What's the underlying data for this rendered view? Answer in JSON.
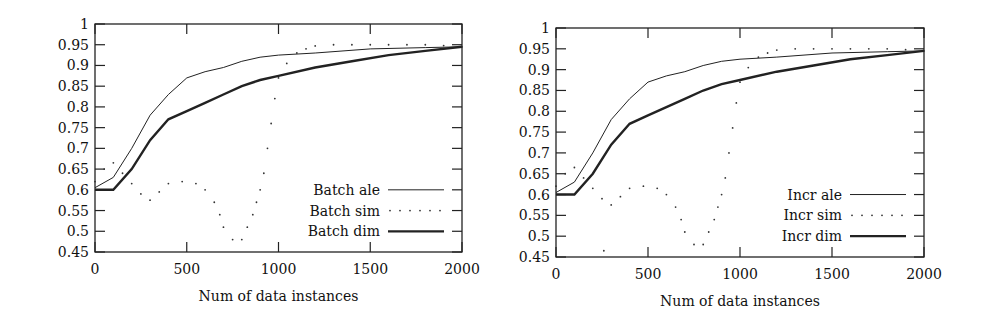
{
  "chart_data": [
    {
      "type": "line",
      "title": "",
      "xlabel": "Num of data instances",
      "ylabel": "",
      "xlim": [
        0,
        2000
      ],
      "ylim": [
        0.45,
        1
      ],
      "xticks": [
        0,
        500,
        1000,
        1500,
        2000
      ],
      "yticks": [
        0.45,
        0.5,
        0.55,
        0.6,
        0.65,
        0.7,
        0.75,
        0.8,
        0.85,
        0.9,
        0.95,
        1
      ],
      "ytick_labels": [
        "0.45",
        "0.5",
        "0.55",
        "0.6",
        "0.65",
        "0.7",
        "0.75",
        "0.8",
        "0.85",
        "0.9",
        "0.95",
        "1"
      ],
      "grid": false,
      "legend_position": "lower right",
      "series": [
        {
          "name": "Batch ale",
          "style": "thin",
          "x": [
            0,
            100,
            200,
            300,
            400,
            500,
            600,
            700,
            800,
            900,
            1000,
            1200,
            1500,
            1800,
            2000
          ],
          "y": [
            0.605,
            0.63,
            0.7,
            0.78,
            0.83,
            0.87,
            0.885,
            0.895,
            0.91,
            0.92,
            0.925,
            0.93,
            0.94,
            0.943,
            0.945
          ]
        },
        {
          "name": "Batch sim",
          "style": "dotted",
          "x": [
            0,
            50,
            100,
            150,
            200,
            250,
            300,
            350,
            400,
            475,
            550,
            600,
            650,
            680,
            700,
            750,
            800,
            830,
            860,
            880,
            900,
            920,
            940,
            960,
            980,
            1000,
            1045,
            1100,
            1150,
            1200,
            1300,
            1400,
            1500,
            1600,
            1700,
            1800,
            1900,
            2000
          ],
          "y": [
            0.62,
            0.65,
            0.665,
            0.64,
            0.615,
            0.59,
            0.575,
            0.595,
            0.615,
            0.62,
            0.615,
            0.6,
            0.57,
            0.54,
            0.51,
            0.48,
            0.48,
            0.51,
            0.54,
            0.57,
            0.6,
            0.64,
            0.7,
            0.76,
            0.82,
            0.87,
            0.905,
            0.93,
            0.94,
            0.947,
            0.95,
            0.95,
            0.95,
            0.95,
            0.95,
            0.95,
            0.948,
            0.945
          ]
        },
        {
          "name": "Batch dim",
          "style": "thick",
          "x": [
            0,
            100,
            200,
            300,
            400,
            500,
            600,
            700,
            800,
            900,
            1000,
            1200,
            1400,
            1600,
            1800,
            2000
          ],
          "y": [
            0.6,
            0.6,
            0.65,
            0.72,
            0.77,
            0.79,
            0.81,
            0.83,
            0.85,
            0.865,
            0.875,
            0.895,
            0.91,
            0.925,
            0.935,
            0.945
          ]
        }
      ]
    },
    {
      "type": "line",
      "title": "",
      "xlabel": "Num of data instances",
      "ylabel": "",
      "xlim": [
        0,
        2000
      ],
      "ylim": [
        0.45,
        1
      ],
      "xticks": [
        0,
        500,
        1000,
        1500,
        2000
      ],
      "yticks": [
        0.45,
        0.5,
        0.55,
        0.6,
        0.65,
        0.7,
        0.75,
        0.8,
        0.85,
        0.9,
        0.95,
        1
      ],
      "ytick_labels": [
        "0.45",
        "0.5",
        "0.55",
        "0.6",
        "0.65",
        "0.7",
        "0.75",
        "0.8",
        "0.85",
        "0.9",
        "0.95",
        "1"
      ],
      "grid": false,
      "legend_position": "lower right",
      "series": [
        {
          "name": "Incr ale",
          "style": "thin",
          "x": [
            0,
            100,
            200,
            300,
            400,
            500,
            600,
            700,
            800,
            900,
            1000,
            1200,
            1500,
            1800,
            2000
          ],
          "y": [
            0.605,
            0.63,
            0.7,
            0.78,
            0.83,
            0.87,
            0.885,
            0.895,
            0.91,
            0.92,
            0.925,
            0.93,
            0.94,
            0.943,
            0.945
          ]
        },
        {
          "name": "Incr sim",
          "style": "dotted",
          "x": [
            0,
            50,
            100,
            150,
            200,
            250,
            260,
            300,
            350,
            400,
            475,
            550,
            600,
            650,
            680,
            700,
            750,
            800,
            830,
            860,
            880,
            900,
            920,
            940,
            960,
            980,
            1000,
            1045,
            1100,
            1150,
            1200,
            1300,
            1400,
            1500,
            1600,
            1700,
            1800,
            1900,
            2000
          ],
          "y": [
            0.62,
            0.65,
            0.665,
            0.64,
            0.615,
            0.59,
            0.465,
            0.575,
            0.595,
            0.615,
            0.62,
            0.615,
            0.6,
            0.57,
            0.54,
            0.51,
            0.48,
            0.48,
            0.51,
            0.54,
            0.57,
            0.6,
            0.64,
            0.7,
            0.76,
            0.82,
            0.87,
            0.905,
            0.93,
            0.94,
            0.947,
            0.95,
            0.95,
            0.95,
            0.95,
            0.95,
            0.95,
            0.948,
            0.945
          ]
        },
        {
          "name": "Incr dim",
          "style": "thick",
          "x": [
            0,
            100,
            200,
            300,
            400,
            500,
            600,
            700,
            800,
            900,
            1000,
            1200,
            1400,
            1600,
            1800,
            2000
          ],
          "y": [
            0.6,
            0.6,
            0.65,
            0.72,
            0.77,
            0.79,
            0.81,
            0.83,
            0.85,
            0.865,
            0.875,
            0.895,
            0.91,
            0.925,
            0.935,
            0.945
          ]
        }
      ]
    }
  ],
  "layout": [
    {
      "left": 95,
      "right": 462,
      "top": 24,
      "bottom": 252
    },
    {
      "left": 556,
      "right": 924,
      "top": 28,
      "bottom": 257
    }
  ]
}
